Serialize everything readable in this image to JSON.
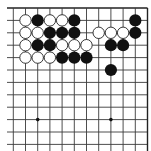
{
  "board": {
    "title": "Go board fragment (top-right corner)",
    "colors": {
      "background": "#ffffff",
      "line": "#3a3a3a",
      "black": "#111111",
      "white": "#ffffff"
    },
    "grid": {
      "cols": 12,
      "rows": 12,
      "x0": 13.3,
      "y0": 8,
      "dx": 12.2,
      "dy": 12.4
    },
    "edges": {
      "top": true,
      "right": true,
      "left": false,
      "bottom": false
    },
    "star_points": [
      {
        "col": 2,
        "row": 9
      },
      {
        "col": 8,
        "row": 9
      }
    ],
    "stones": [
      {
        "color": "white",
        "col": 1,
        "row": 1
      },
      {
        "color": "black",
        "col": 2,
        "row": 1
      },
      {
        "color": "white",
        "col": 3,
        "row": 1
      },
      {
        "color": "white",
        "col": 4,
        "row": 1
      },
      {
        "color": "black",
        "col": 5,
        "row": 1
      },
      {
        "color": "black",
        "col": 10,
        "row": 1
      },
      {
        "color": "white",
        "col": 1,
        "row": 2
      },
      {
        "color": "white",
        "col": 2,
        "row": 2
      },
      {
        "color": "black",
        "col": 3,
        "row": 2
      },
      {
        "color": "black",
        "col": 4,
        "row": 2
      },
      {
        "color": "black",
        "col": 5,
        "row": 2
      },
      {
        "color": "white",
        "col": 7,
        "row": 2
      },
      {
        "color": "white",
        "col": 8,
        "row": 2
      },
      {
        "color": "white",
        "col": 9,
        "row": 2
      },
      {
        "color": "black",
        "col": 10,
        "row": 2
      },
      {
        "color": "white",
        "col": 1,
        "row": 3
      },
      {
        "color": "black",
        "col": 2,
        "row": 3
      },
      {
        "color": "black",
        "col": 3,
        "row": 3
      },
      {
        "color": "white",
        "col": 4,
        "row": 3
      },
      {
        "color": "white",
        "col": 5,
        "row": 3
      },
      {
        "color": "white",
        "col": 6,
        "row": 3
      },
      {
        "color": "black",
        "col": 8,
        "row": 3
      },
      {
        "color": "black",
        "col": 9,
        "row": 3
      },
      {
        "color": "white",
        "col": 1,
        "row": 4
      },
      {
        "color": "white",
        "col": 2,
        "row": 4
      },
      {
        "color": "white",
        "col": 3,
        "row": 4
      },
      {
        "color": "black",
        "col": 4,
        "row": 4
      },
      {
        "color": "black",
        "col": 5,
        "row": 4
      },
      {
        "color": "black",
        "col": 6,
        "row": 4
      },
      {
        "color": "black",
        "col": 8,
        "row": 5
      }
    ]
  }
}
